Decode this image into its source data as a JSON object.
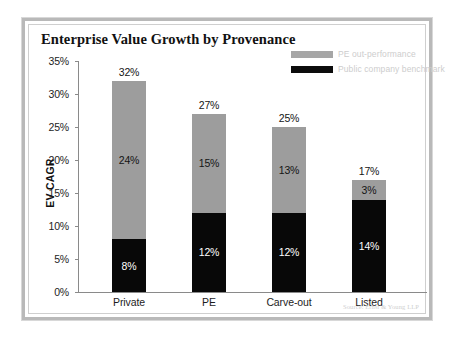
{
  "chart_data": {
    "type": "bar",
    "subtype": "stacked-bar",
    "title": "Enterprise Value Growth by Provenance",
    "xlabel": "",
    "ylabel": "EV CAGR",
    "ylim": [
      0,
      35
    ],
    "ytick_labels": [
      "35%",
      "30%",
      "25%",
      "20%",
      "15%",
      "10%",
      "5%",
      "0%"
    ],
    "ytick_values": [
      35,
      30,
      25,
      20,
      15,
      10,
      5,
      0
    ],
    "grid": false,
    "legend_position": "top-right",
    "categories": [
      "Private",
      "PE",
      "Carve-out",
      "Listed"
    ],
    "series": [
      {
        "name": "Public company benchmark",
        "color": "#080808",
        "values": [
          8,
          12,
          12,
          14
        ],
        "labels": [
          "8%",
          "12%",
          "12%",
          "14%"
        ]
      },
      {
        "name": "PE out-performance",
        "color": "#9d9d9d",
        "values": [
          24,
          15,
          13,
          3
        ],
        "labels": [
          "24%",
          "15%",
          "13%",
          "3%"
        ]
      }
    ],
    "totals": [
      32,
      27,
      25,
      17
    ],
    "total_labels": [
      "32%",
      "27%",
      "25%",
      "17%"
    ],
    "source": "Source: Ernst & Young LLP"
  },
  "legend": {
    "items": [
      {
        "label": "PE out-performance",
        "color": "#a6a6a6"
      },
      {
        "label": "Public company benchmark",
        "color": "#0c0c0c"
      }
    ]
  },
  "colors": {
    "gray_segment": "#9d9d9d",
    "black_segment": "#080808",
    "frame": "#b9b9b9",
    "axis": "#8a8a8a"
  }
}
